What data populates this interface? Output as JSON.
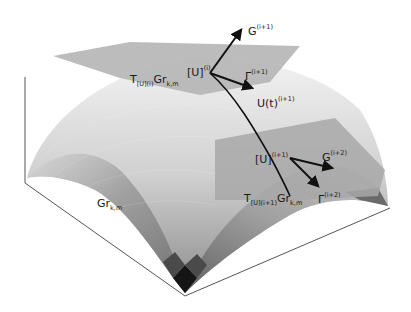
{
  "figure": {
    "type": "3D surface diagram of Grassmann manifold with tangent planes and geodesic",
    "surface_label": {
      "base": "Gr",
      "sub": "k,m"
    },
    "tangent_plane_1": {
      "label": {
        "prefix": "T",
        "sub_point": "[U]",
        "sup_point": "(i)",
        "base": "Gr",
        "sub": "k,m"
      },
      "point": {
        "base": "[U]",
        "sup": "(i)"
      },
      "vectors": [
        {
          "base": "G",
          "sup": "(i+1)"
        },
        {
          "base": "Γ",
          "sup": "(i+1)"
        }
      ]
    },
    "geodesic": {
      "base": "U(t)",
      "sup": "(i+1)"
    },
    "tangent_plane_2": {
      "label": {
        "prefix": "T",
        "sub_point": "[U]",
        "sup_point": "(i+1)",
        "base": "Gr",
        "sub": "k,m"
      },
      "point": {
        "base": "[U]",
        "sup": "(i+1)"
      },
      "vectors": [
        {
          "base": "G",
          "sup": "(i+2)"
        },
        {
          "base": "Γ",
          "sup": "(i+2)"
        }
      ]
    },
    "colors": {
      "background": "#ffffff",
      "axis": "#555555",
      "plane": "#b8b8b8",
      "arrow": "#111111",
      "surface_light": "#e6e6e6",
      "surface_dark": "#1a1a1a"
    }
  }
}
